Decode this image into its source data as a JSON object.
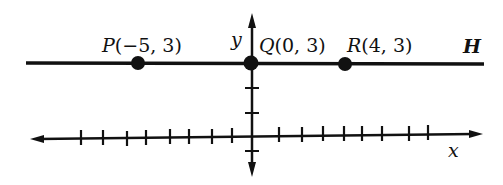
{
  "diagram": {
    "type": "coordinate-plane",
    "axes": {
      "x_label": "x",
      "y_label": "y"
    },
    "line": {
      "label": "H",
      "description": "horizontal line y = 3"
    },
    "points": [
      {
        "name": "P",
        "coords": "(−5, 3)",
        "x": -5,
        "y": 3
      },
      {
        "name": "Q",
        "coords": "(0, 3)",
        "x": 0,
        "y": 3
      },
      {
        "name": "R",
        "coords": "(4, 3)",
        "x": 4,
        "y": 3
      }
    ],
    "colors": {
      "ink": "#111111",
      "background": "#ffffff"
    }
  }
}
